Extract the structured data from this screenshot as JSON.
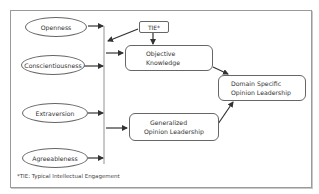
{
  "diagram": {
    "predictors": [
      {
        "id": "openness",
        "label": "Openness"
      },
      {
        "id": "conscientiousness",
        "label": "Conscientiousness"
      },
      {
        "id": "extraversion",
        "label": "Extraversion"
      },
      {
        "id": "agreeableness",
        "label": "Agreeableness"
      }
    ],
    "moderator": {
      "id": "tie",
      "label": "TIE*"
    },
    "mediators": [
      {
        "id": "objective_knowledge",
        "lines": [
          "Objective",
          "Knowledge"
        ]
      },
      {
        "id": "generalized_opinion_leadership",
        "lines": [
          "Generalized",
          "Opinion Leadership"
        ]
      }
    ],
    "outcome": {
      "id": "domain_specific_opinion_leadership",
      "lines": [
        "Domain Specific",
        "Opinion Leadership"
      ]
    },
    "edges": [
      {
        "from": "openness",
        "to": "predictor_bus"
      },
      {
        "from": "conscientiousness",
        "to": "predictor_bus"
      },
      {
        "from": "extraversion",
        "to": "predictor_bus"
      },
      {
        "from": "agreeableness",
        "to": "predictor_bus"
      },
      {
        "from": "tie",
        "to": "predictor_bus"
      },
      {
        "from": "tie",
        "to": "objective_knowledge"
      },
      {
        "from": "predictor_bus",
        "to": "objective_knowledge"
      },
      {
        "from": "predictor_bus",
        "to": "generalized_opinion_leadership"
      },
      {
        "from": "objective_knowledge",
        "to": "domain_specific_opinion_leadership"
      },
      {
        "from": "generalized_opinion_leadership",
        "to": "domain_specific_opinion_leadership"
      }
    ],
    "footnote": "*TIE: Typical Intellectual Engagement"
  },
  "colors": {
    "stroke": "#666666",
    "arrow": "#333333",
    "frame": "#9a9a9a"
  }
}
